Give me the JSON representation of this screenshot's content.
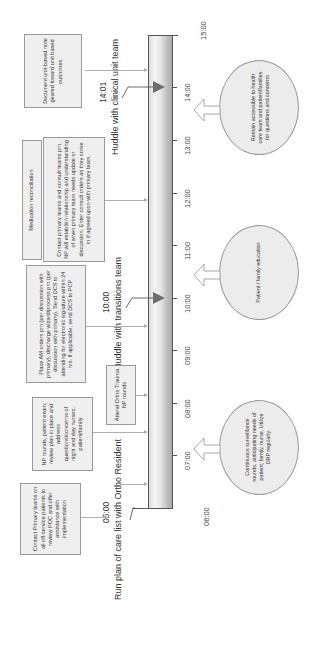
{
  "diagram": {
    "orientation": "rotated -90deg (timeline runs bottom to top)",
    "timeline": {
      "ticks": [
        "06:00",
        "07:00",
        "08:00",
        "09:00",
        "10:00",
        "11:00",
        "12:00",
        "13:00",
        "14:00",
        "15:00"
      ]
    },
    "events": [
      {
        "time": "06:00",
        "label": "Run plan of care list with Ortho Resident"
      },
      {
        "time": "10:00",
        "label": "Huddle with transitions team"
      },
      {
        "time": "14:01",
        "label": "Huddle with clinical unit team"
      }
    ],
    "tasks": [
      {
        "id": "contact-primary",
        "text": "Contact Primary teams on all off-service patients to review POC and offer assistance with implementation"
      },
      {
        "id": "np-rounds",
        "text": "NP rounds, patient exam, review plan in place and address questions/concerns of night and day nurses, patient/family"
      },
      {
        "id": "ortho-rounds",
        "text": "Attend Ortho Trauma NP rounds"
      },
      {
        "id": "am-orders",
        "text": "Place AM orders prn (per discussion with primary), discharge wizard/process prn (per discussion with primary). Send DCS to attending for electronic signature within 24 hrs. If applicable, send DCS to PCP"
      },
      {
        "id": "med-rec",
        "text": "Medication reconciliation"
      },
      {
        "id": "contact-consult",
        "text": "Contact primary teams and consult teams prn. NP will establish relationship and understanding of when primary team needs update or discussion. Enter consult orders as they come in if agreed upon with primary team."
      },
      {
        "id": "document",
        "text": "Document unit-based note geared toward unit based outcomes."
      }
    ],
    "ongoing": [
      {
        "id": "surveillance",
        "text": "Continuous surveillance rounds, anticipating needs of patient, family, nurse. Utilize DRP regularly."
      },
      {
        "id": "education",
        "text": "Patient / family education"
      },
      {
        "id": "accessible",
        "text": "Remain accessible to health care team and patient/families for questions and concerns"
      }
    ],
    "colors": {
      "bar_light": "#f4f4f4",
      "bar_dark": "#aaaaaa",
      "box_fill": "#efefef",
      "border": "#9a9a9a",
      "marker": "#6e6e6e"
    }
  }
}
